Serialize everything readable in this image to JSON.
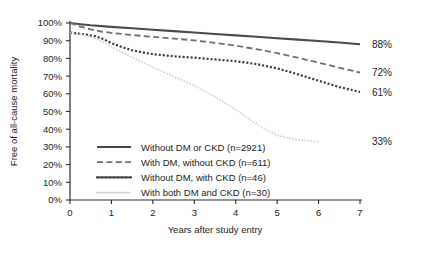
{
  "chart_data": {
    "type": "line",
    "title": "",
    "xlabel": "Years after study entry",
    "ylabel": "Free of all-cause mortality",
    "xlim": [
      0,
      7
    ],
    "ylim": [
      0,
      100
    ],
    "xticks": [
      0,
      1,
      2,
      3,
      4,
      5,
      6,
      7
    ],
    "xtick_labels": [
      "0",
      "1",
      "2",
      "3",
      "4",
      "5",
      "6",
      "7"
    ],
    "yticks": [
      0,
      10,
      20,
      30,
      40,
      50,
      60,
      70,
      80,
      90,
      100
    ],
    "ytick_labels": [
      "0%",
      "10%",
      "20%",
      "30%",
      "40%",
      "50%",
      "60%",
      "70%",
      "80%",
      "90%",
      "100%"
    ],
    "grid": false,
    "legend_position": "inside-lower-left",
    "series": [
      {
        "name": "Without DM or CKD (n=2921)",
        "group": "Without DM or CKD",
        "n": 2921,
        "style": "solid",
        "color": "#4a4a4a",
        "width": 2.1,
        "end_label": "88%",
        "x": [
          0,
          0.25,
          0.5,
          1,
          1.5,
          2,
          2.5,
          3,
          3.5,
          4,
          4.5,
          5,
          5.5,
          6,
          6.5,
          7
        ],
        "y": [
          100,
          99.3,
          98.7,
          97.8,
          97.0,
          96.2,
          95.4,
          94.6,
          93.8,
          93.0,
          92.2,
          91.4,
          90.6,
          89.8,
          89.0,
          88.0
        ]
      },
      {
        "name": "With DM, without CKD (n=611)",
        "group": "With DM, without CKD",
        "n": 611,
        "style": "dashed",
        "color": "#6e6e6e",
        "width": 1.8,
        "end_label": "72%",
        "x": [
          0,
          0.25,
          0.5,
          0.75,
          1,
          1.5,
          2,
          2.5,
          3,
          3.5,
          4,
          4.5,
          5,
          5.5,
          6,
          6.5,
          7
        ],
        "y": [
          100,
          98.0,
          96.4,
          95.2,
          94.4,
          93.2,
          92.2,
          91.2,
          90.2,
          88.8,
          87.2,
          85.2,
          83.0,
          80.4,
          77.6,
          74.8,
          72.0
        ]
      },
      {
        "name": "Without DM, with CKD (n=46)",
        "group": "Without DM, with CKD",
        "n": 46,
        "style": "dotted",
        "color": "#3c3c3c",
        "width": 2.2,
        "end_label": "61%",
        "x": [
          0,
          0.2,
          0.4,
          0.6,
          0.8,
          1,
          1.25,
          1.5,
          1.75,
          2,
          2.5,
          3,
          3.5,
          4,
          4.5,
          5,
          5.5,
          6,
          6.5,
          7
        ],
        "y": [
          94.5,
          94.0,
          93.4,
          92.6,
          91.0,
          88.6,
          86.4,
          84.6,
          83.4,
          82.4,
          81.2,
          80.4,
          79.4,
          78.4,
          76.8,
          74.4,
          71.0,
          67.4,
          63.8,
          61.0
        ]
      },
      {
        "name": "With both DM and CKD (n=30)",
        "group": "With both DM and CKD",
        "n": 30,
        "style": "fine-dotted",
        "color": "#cfcfcf",
        "width": 1.7,
        "end_label": "33%",
        "x": [
          0,
          0.2,
          0.4,
          0.6,
          0.8,
          1,
          1.5,
          2,
          2.5,
          3,
          3.5,
          4,
          4.5,
          5,
          5.5,
          6
        ],
        "y": [
          94.5,
          93.8,
          92.8,
          91.4,
          89.4,
          86.6,
          80.6,
          75.0,
          69.8,
          64.6,
          58.4,
          51.0,
          43.0,
          36.4,
          34.0,
          33.0
        ]
      }
    ],
    "end_labels": [
      {
        "text": "88%",
        "value": 88,
        "series": "Without DM or CKD (n=2921)"
      },
      {
        "text": "72%",
        "value": 72,
        "series": "With DM, without CKD (n=611)"
      },
      {
        "text": "61%",
        "value": 61,
        "series": "Without DM, with CKD (n=46)"
      },
      {
        "text": "33%",
        "value": 33,
        "series": "With both DM and CKD (n=30)"
      }
    ]
  },
  "colors": {
    "axis": "#2b2b2b",
    "text": "#1c1c1c",
    "background": "#ffffff"
  }
}
